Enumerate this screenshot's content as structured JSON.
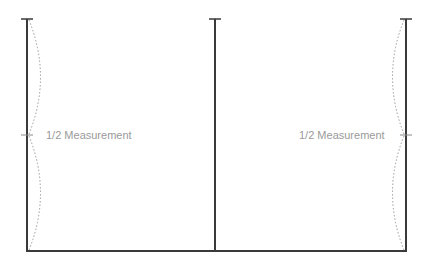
{
  "diagram": {
    "type": "measurement-diagram",
    "colors": {
      "post": "#3a3a3a",
      "dashed_arc": "#9a9a9a",
      "label": "#9a9a9a",
      "background": "#ffffff"
    },
    "posts": [
      {
        "name": "left-post",
        "x": 27,
        "top": 19,
        "bottom": 251
      },
      {
        "name": "middle-post",
        "x": 215,
        "top": 19,
        "bottom": 251
      },
      {
        "name": "right-post",
        "x": 406,
        "top": 19,
        "bottom": 251
      }
    ],
    "bottom_rail": {
      "x1": 27,
      "x2": 406,
      "y": 251
    },
    "midpoint_y": 135,
    "labels": {
      "left": "1/2 Measurement",
      "right": "1/2 Measurement"
    }
  }
}
